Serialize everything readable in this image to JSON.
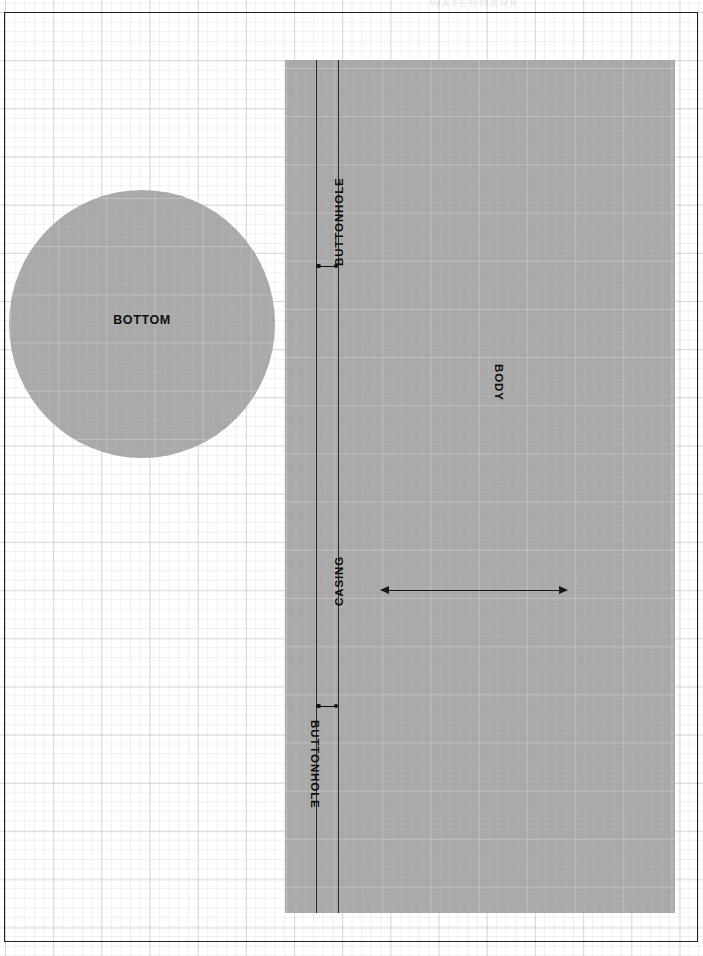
{
  "document": {
    "title": "Sewing Pattern Layout",
    "watermark_text": "WATERMARK"
  },
  "pieces": [
    {
      "id": "bottom",
      "label": "BOTTOM",
      "shape": "circle",
      "orientation": "horizontal"
    },
    {
      "id": "body",
      "label": "BODY",
      "shape": "rectangle",
      "orientation": "vertical-down"
    }
  ],
  "labels": {
    "bottom": "BOTTOM",
    "body": "BODY",
    "casing": "CASING",
    "buttonhole_top": "BUTTONHOLE",
    "buttonhole_bottom": "BUTTONHOLE"
  },
  "colors": {
    "piece_fill": "#9a9a9a",
    "line": "#1e1e1e",
    "grid": "#c8c8c8",
    "page": "#ffffff",
    "text": "#0d0d0d"
  },
  "grid": {
    "major_spacing_px": 48,
    "minor_spacing_px": 10,
    "visible": true
  },
  "annotations": {
    "dimension_arrow": {
      "type": "double-headed-arrow",
      "label": "",
      "direction": "horizontal"
    },
    "buttonhole_markers": 2
  }
}
